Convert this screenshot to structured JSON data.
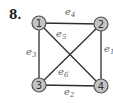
{
  "problem": {
    "number": "8."
  },
  "graph": {
    "nodes": [
      {
        "id": "1",
        "label": "1",
        "x": 39,
        "y": 23
      },
      {
        "id": "2",
        "label": "2",
        "x": 101,
        "y": 24
      },
      {
        "id": "3",
        "label": "3",
        "x": 39,
        "y": 85
      },
      {
        "id": "4",
        "label": "4",
        "x": 101,
        "y": 86
      }
    ],
    "edges": [
      {
        "name": "e",
        "sub": "1",
        "from": "2",
        "to": "4",
        "lx": 104,
        "ly": 52
      },
      {
        "name": "e",
        "sub": "2",
        "from": "3",
        "to": "4",
        "lx": 64,
        "ly": 95
      },
      {
        "name": "e",
        "sub": "3",
        "from": "1",
        "to": "3",
        "lx": 26,
        "ly": 55
      },
      {
        "name": "e",
        "sub": "4",
        "from": "1",
        "to": "2",
        "lx": 65,
        "ly": 15
      },
      {
        "name": "e",
        "sub": "5",
        "from": "1",
        "to": "4",
        "lx": 56,
        "ly": 37
      },
      {
        "name": "e",
        "sub": "6",
        "from": "2",
        "to": "3",
        "lx": 58,
        "ly": 75
      }
    ]
  },
  "colors": {
    "node_fill": "#c4c4c4",
    "edge": "#2e2e2e",
    "label": "#666666"
  }
}
